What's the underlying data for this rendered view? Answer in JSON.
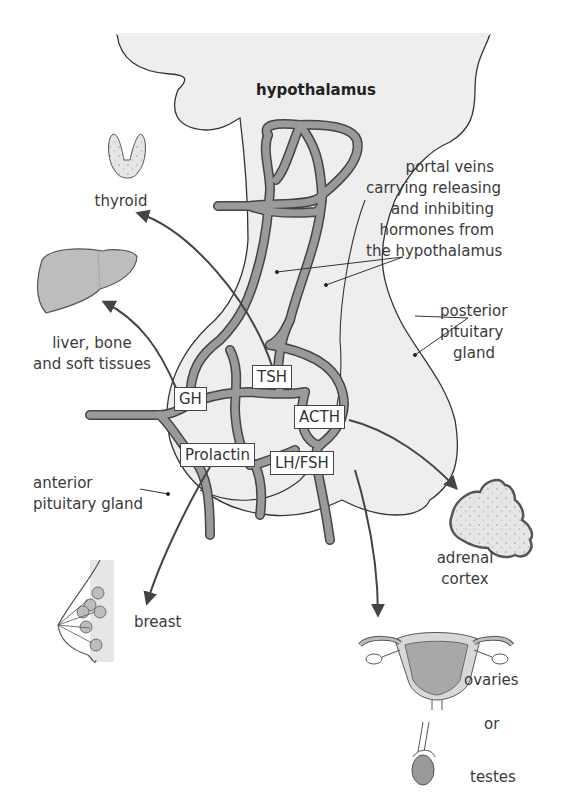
{
  "figure": {
    "title": "hypothalamus",
    "colors": {
      "tissue_fill": "#eeeeee",
      "vessel_fill": "#9a9a9a",
      "outline": "#444444",
      "organ_fill": "#bdbdbd",
      "text": "#3a3a3a"
    }
  },
  "labels": {
    "hypothalamus": "hypothalamus",
    "portal_veins": [
      "portal veins",
      "carrying releasing",
      "and inhibiting",
      "hormones from",
      "the hypothalamus"
    ],
    "posterior_pituitary": [
      "posterior",
      "pituitary",
      "gland"
    ],
    "anterior_pituitary": [
      "anterior",
      "pituitary gland"
    ],
    "thyroid": "thyroid",
    "liver": [
      "liver, bone",
      "and soft tissues"
    ],
    "breast": "breast",
    "adrenal": [
      "adrenal",
      "cortex"
    ],
    "ovaries": "ovaries",
    "or": "or",
    "testes": "testes"
  },
  "hormones": [
    {
      "id": "gh",
      "label": "GH",
      "target": "liver, bone and soft tissues"
    },
    {
      "id": "tsh",
      "label": "TSH",
      "target": "thyroid"
    },
    {
      "id": "acth",
      "label": "ACTH",
      "target": "adrenal cortex"
    },
    {
      "id": "prolactin",
      "label": "Prolactin",
      "target": "breast"
    },
    {
      "id": "lhfsh",
      "label": "LH/FSH",
      "target": "ovaries or testes"
    }
  ]
}
